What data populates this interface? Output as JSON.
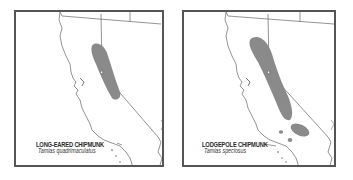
{
  "maps": [
    {
      "id": "left",
      "common_name": "LONG-EARED CHIPMUNK",
      "scientific_name": "Tamias quadrimaculatus",
      "range_color": "#8a8a8a"
    },
    {
      "id": "right",
      "common_name": "LODGEPOLE CHIPMUNK",
      "scientific_name": "Tamias speciosus",
      "range_color": "#8a8a8a"
    }
  ],
  "colors": {
    "border": "#555555",
    "outline": "#555555",
    "range": "#8a8a8a",
    "background": "#ffffff"
  }
}
